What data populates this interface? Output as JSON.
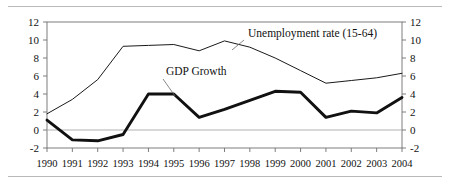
{
  "chart_data": {
    "type": "line",
    "title": "",
    "xlabel": "",
    "ylabel": "",
    "ylim": [
      -2,
      12
    ],
    "yticks": [
      -2,
      0,
      2,
      4,
      6,
      8,
      10,
      12
    ],
    "dual_axis": true,
    "right_axis_same_as_left": true,
    "grid": false,
    "zero_line": true,
    "legend_position": "inline-annotation",
    "categories": [
      "1990",
      "1991",
      "1992",
      "1993",
      "1994",
      "1995",
      "1996",
      "1997",
      "1998",
      "1999",
      "2000",
      "2001",
      "2002",
      "2003",
      "2004"
    ],
    "series": [
      {
        "name": "Unemployment rate (15-64)",
        "style": "thin",
        "color": "#1a1a1a",
        "values": [
          1.8,
          3.4,
          5.6,
          9.3,
          9.4,
          9.5,
          8.8,
          9.9,
          9.2,
          8.0,
          6.6,
          5.2,
          5.5,
          5.8,
          6.3
        ]
      },
      {
        "name": "GDP Growth",
        "style": "thick",
        "color": "#111111",
        "values": [
          1.1,
          -1.1,
          -1.2,
          -0.5,
          4.0,
          4.0,
          1.4,
          2.3,
          3.3,
          4.3,
          4.2,
          1.4,
          2.1,
          1.9,
          3.6
        ]
      }
    ],
    "annotations": [
      {
        "name": "Unemployment rate (15-64)",
        "text": "Unemployment rate (15-64)",
        "anchor_year": "1997",
        "anchor_value": 9.9
      },
      {
        "name": "GDP Growth",
        "text": "GDP Growth",
        "anchor_year": "1994",
        "anchor_value": 4.0
      }
    ]
  },
  "axes": {
    "left_ticks": [
      "12",
      "10",
      "8",
      "6",
      "4",
      "2",
      "0",
      "-2"
    ],
    "right_ticks": [
      "12",
      "10",
      "8",
      "6",
      "4",
      "2",
      "0",
      "-2"
    ],
    "years": [
      "1990",
      "1991",
      "1992",
      "1993",
      "1994",
      "1995",
      "1996",
      "1997",
      "1998",
      "1999",
      "2000",
      "2001",
      "2002",
      "2003",
      "2004"
    ]
  },
  "labels": {
    "unemployment": "Unemployment rate (15-64)",
    "gdp": "GDP Growth"
  }
}
